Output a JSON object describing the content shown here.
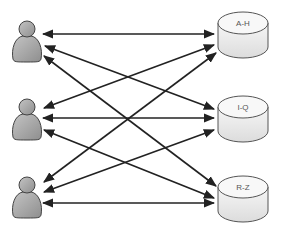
{
  "diagram": {
    "users": [
      {
        "id": "user-1",
        "label": ""
      },
      {
        "id": "user-2",
        "label": ""
      },
      {
        "id": "user-3",
        "label": ""
      }
    ],
    "databases": [
      {
        "id": "db-a-h",
        "label": "A-H"
      },
      {
        "id": "db-i-q",
        "label": "I-Q"
      },
      {
        "id": "db-r-z",
        "label": "R-Z"
      }
    ],
    "connections": [
      {
        "from": "user-1",
        "to": "db-a-h",
        "bidirectional": true
      },
      {
        "from": "user-1",
        "to": "db-i-q",
        "bidirectional": true
      },
      {
        "from": "user-1",
        "to": "db-r-z",
        "bidirectional": true
      },
      {
        "from": "user-2",
        "to": "db-a-h",
        "bidirectional": true
      },
      {
        "from": "user-2",
        "to": "db-i-q",
        "bidirectional": true
      },
      {
        "from": "user-2",
        "to": "db-r-z",
        "bidirectional": true
      },
      {
        "from": "user-3",
        "to": "db-a-h",
        "bidirectional": true
      },
      {
        "from": "user-3",
        "to": "db-i-q",
        "bidirectional": true
      },
      {
        "from": "user-3",
        "to": "db-r-z",
        "bidirectional": true
      }
    ],
    "colors": {
      "arrow": "#222222",
      "user_fill": "#a8a8a8",
      "user_stroke": "#444444",
      "db_fill": "#f0f0f0",
      "db_stroke": "#555555"
    }
  }
}
